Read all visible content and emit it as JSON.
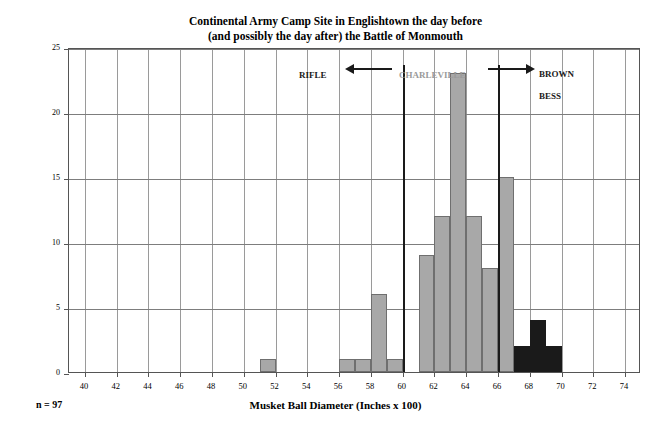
{
  "chart_data": {
    "type": "bar",
    "title": "Continental Army Camp Site in Englishtown the day before\n(and possibly the day after) the Battle of Monmouth",
    "title_line1": "Continental Army Camp Site in Englishtown the day before",
    "title_line2": "(and possibly the day after) the Battle of Monmouth",
    "xlabel": "Musket Ball Diameter (Inches x 100)",
    "ylabel": "Number of Musket Balls",
    "sample_size_label": "n = 97",
    "grid": true,
    "legend_position": "none",
    "xlim": [
      39,
      75
    ],
    "ylim": [
      0,
      25
    ],
    "ytick_labels": [
      "0",
      "5",
      "10",
      "15",
      "20",
      "25"
    ],
    "yticks": [
      0,
      5,
      10,
      15,
      20,
      25
    ],
    "xtick_labels": [
      "40",
      "42",
      "44",
      "46",
      "48",
      "50",
      "52",
      "54",
      "56",
      "58",
      "60",
      "62",
      "64",
      "66",
      "68",
      "70",
      "72",
      "74"
    ],
    "xticks": [
      40,
      42,
      44,
      46,
      48,
      50,
      52,
      54,
      56,
      58,
      60,
      62,
      64,
      66,
      68,
      70,
      72,
      74
    ],
    "bin_width": 1,
    "colors": {
      "charleville_bar": "#a8a8a8",
      "brown_bess_bar": "#1a1a1a",
      "bar_outline": "#6f6f6f",
      "grid": "#9a9a9a",
      "frame": "#555555",
      "annotation_gray": "#9a9a9a",
      "annotation_black": "#1a1a1a"
    },
    "bars": [
      {
        "bin_start": 51,
        "bin_end": 52,
        "value": 1,
        "group": "charleville"
      },
      {
        "bin_start": 56,
        "bin_end": 57,
        "value": 1,
        "group": "charleville"
      },
      {
        "bin_start": 57,
        "bin_end": 58,
        "value": 1,
        "group": "charleville"
      },
      {
        "bin_start": 58,
        "bin_end": 59,
        "value": 6,
        "group": "charleville"
      },
      {
        "bin_start": 59,
        "bin_end": 60,
        "value": 1,
        "group": "charleville"
      },
      {
        "bin_start": 61,
        "bin_end": 62,
        "value": 9,
        "group": "charleville"
      },
      {
        "bin_start": 62,
        "bin_end": 63,
        "value": 12,
        "group": "charleville"
      },
      {
        "bin_start": 63,
        "bin_end": 64,
        "value": 23,
        "group": "charleville"
      },
      {
        "bin_start": 64,
        "bin_end": 65,
        "value": 12,
        "group": "charleville"
      },
      {
        "bin_start": 65,
        "bin_end": 66,
        "value": 8,
        "group": "charleville"
      },
      {
        "bin_start": 66,
        "bin_end": 67,
        "value": 15,
        "group": "charleville"
      },
      {
        "bin_start": 67,
        "bin_end": 68,
        "value": 2,
        "group": "brown_bess"
      },
      {
        "bin_start": 68,
        "bin_end": 69,
        "value": 4,
        "group": "brown_bess"
      },
      {
        "bin_start": 69,
        "bin_end": 70,
        "value": 2,
        "group": "brown_bess"
      }
    ],
    "annotations": [
      {
        "id": "rifle",
        "label": "RIFLE",
        "color": "#1a1a1a",
        "arrow": "left",
        "divider_at": 60
      },
      {
        "id": "charleville",
        "label": "CHARLEVILLE",
        "color": "#9a9a9a",
        "arrow": "none"
      },
      {
        "id": "brown-bess",
        "label": "BROWN\nBESS",
        "label_line1": "BROWN",
        "label_line2": "BESS",
        "color": "#1a1a1a",
        "arrow": "right",
        "divider_at": 66
      }
    ]
  }
}
